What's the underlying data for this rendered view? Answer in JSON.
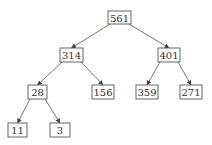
{
  "diagram": {
    "type": "binary-tree",
    "nodes": [
      {
        "id": "n561",
        "label": "561",
        "x": 108,
        "y": 11,
        "w": 23,
        "h": 13
      },
      {
        "id": "n314",
        "label": "314",
        "x": 60,
        "y": 48,
        "w": 23,
        "h": 14
      },
      {
        "id": "n401",
        "label": "401",
        "x": 158,
        "y": 48,
        "w": 22,
        "h": 14
      },
      {
        "id": "n28",
        "label": "28",
        "x": 28,
        "y": 85,
        "w": 19,
        "h": 14
      },
      {
        "id": "n156",
        "label": "156",
        "x": 92,
        "y": 85,
        "w": 22,
        "h": 14
      },
      {
        "id": "n359",
        "label": "359",
        "x": 136,
        "y": 85,
        "w": 22,
        "h": 14
      },
      {
        "id": "n271",
        "label": "271",
        "x": 180,
        "y": 85,
        "w": 22,
        "h": 14
      },
      {
        "id": "n11",
        "label": "11",
        "x": 8,
        "y": 123,
        "w": 19,
        "h": 14
      },
      {
        "id": "n3",
        "label": "3",
        "x": 50,
        "y": 123,
        "w": 20,
        "h": 14
      }
    ],
    "edges": [
      {
        "from": "n561",
        "to": "n314"
      },
      {
        "from": "n561",
        "to": "n401"
      },
      {
        "from": "n314",
        "to": "n28"
      },
      {
        "from": "n314",
        "to": "n156"
      },
      {
        "from": "n401",
        "to": "n359"
      },
      {
        "from": "n401",
        "to": "n271"
      },
      {
        "from": "n28",
        "to": "n11"
      },
      {
        "from": "n28",
        "to": "n3"
      }
    ]
  }
}
